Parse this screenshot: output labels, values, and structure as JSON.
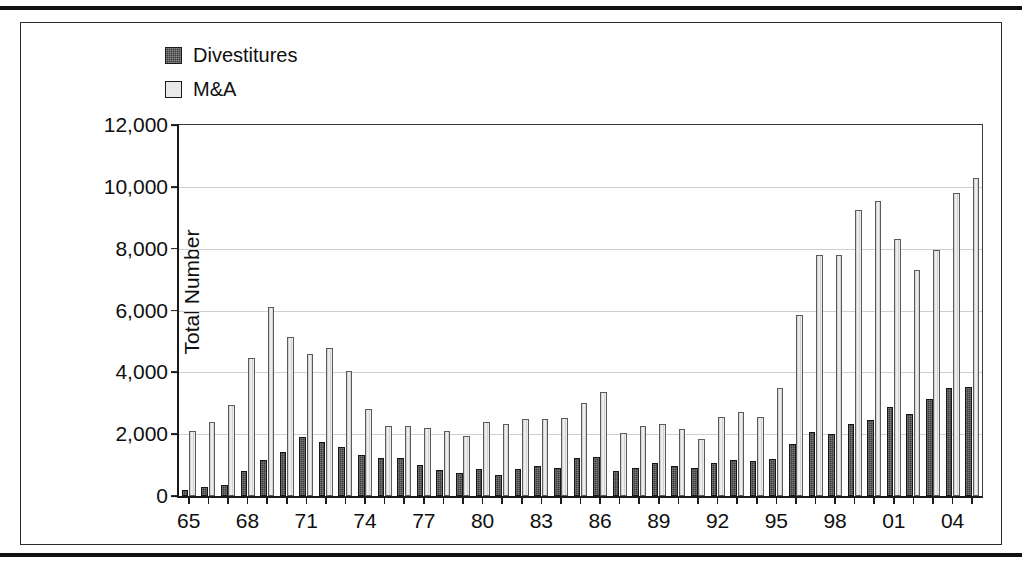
{
  "figure": {
    "frame": true,
    "legend": [
      {
        "name": "divestitures-swatch",
        "label": "Divestitures",
        "color": "#3d3d3d"
      },
      {
        "name": "ma-swatch",
        "label": "M&A",
        "color": "#ededed"
      }
    ]
  },
  "chart_data": {
    "type": "bar",
    "title": "",
    "xlabel": "",
    "ylabel": "Total Number",
    "ylim": [
      0,
      12000
    ],
    "ytick_values": [
      0,
      2000,
      4000,
      6000,
      8000,
      10000,
      12000
    ],
    "ytick_labels": [
      "0",
      "2,000",
      "4,000",
      "6,000",
      "8,000",
      "10,000",
      "12,000"
    ],
    "grid": true,
    "legend_position": "top-left",
    "categories": [
      "65",
      "66",
      "67",
      "68",
      "69",
      "70",
      "71",
      "72",
      "73",
      "74",
      "75",
      "76",
      "77",
      "78",
      "79",
      "80",
      "81",
      "82",
      "83",
      "84",
      "85",
      "86",
      "87",
      "88",
      "89",
      "90",
      "91",
      "92",
      "93",
      "94",
      "95",
      "96",
      "97",
      "98",
      "99",
      "00",
      "01",
      "02",
      "03",
      "04",
      "05"
    ],
    "xtick_labels_shown": [
      "65",
      "68",
      "71",
      "74",
      "77",
      "80",
      "83",
      "86",
      "89",
      "92",
      "95",
      "98",
      "01",
      "04"
    ],
    "series": [
      {
        "name": "Divestitures",
        "color": "#3d3d3d",
        "values": [
          200,
          280,
          350,
          820,
          1180,
          1420,
          1900,
          1760,
          1580,
          1340,
          1230,
          1230,
          1000,
          840,
          760,
          870,
          680,
          860,
          960,
          900,
          1230,
          1270,
          820,
          900,
          1080,
          980,
          910,
          1080,
          1150,
          1140,
          1200,
          1690,
          2080,
          1990,
          2330,
          2470,
          2890,
          2660,
          3130,
          3500,
          3540
        ]
      },
      {
        "name": "M&A",
        "color": "#ededed",
        "values": [
          2100,
          2380,
          2960,
          4450,
          6100,
          5150,
          4600,
          4780,
          4050,
          2820,
          2280,
          2280,
          2200,
          2090,
          1930,
          2390,
          2320,
          2500,
          2490,
          2530,
          3000,
          3350,
          2030,
          2250,
          2330,
          2180,
          1860,
          2540,
          2710,
          2560,
          3500,
          5850,
          7810,
          7810,
          9250,
          9550,
          8300,
          7300,
          7960,
          9790,
          10300
        ]
      }
    ]
  }
}
